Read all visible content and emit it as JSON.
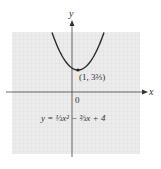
{
  "chart_data": {
    "type": "line",
    "title": "",
    "xlabel": "x",
    "ylabel": "y",
    "origin_label": "0",
    "equation": "y = ⅓x² − ⅔x + 4",
    "vertex": {
      "x": 1,
      "y": 3.6667,
      "label": "(1, 3⅔)"
    },
    "function": {
      "a": 0.3333,
      "b": -0.6667,
      "c": 4
    },
    "xlim": [
      -5,
      7
    ],
    "ylim": [
      -6,
      6
    ],
    "grid": true,
    "colors": {
      "curve": "#2a2a2a",
      "grid_bg": "#ececec",
      "grid_line": "#d8d8d8",
      "axis": "#444444"
    }
  },
  "labels": {
    "y_axis": "y",
    "x_axis": "x",
    "origin": "0",
    "vertex": "(1, 3⅔)",
    "equation": "y = ⅓x² − ⅔x + 4"
  }
}
